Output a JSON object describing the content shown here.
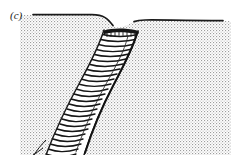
{
  "figure": {
    "panel_label": "(c)",
    "caption_text": "",
    "width_px": 231,
    "height_px": 155,
    "background_color": "#ffffff",
    "type": "geological-cross-section"
  },
  "colors": {
    "stipple_dot": "#9a9a9a",
    "stipple_background": "#ffffff",
    "outline": "#1a1a1a",
    "band_fill": "#ffffff",
    "hatch_line": "#1a1a1a",
    "label_text": "#222222",
    "dark_cap": "#111111"
  },
  "layers": {
    "ground_mass": {
      "name": "stippled-host-rock",
      "fill_pattern": "fine-stipple-dots",
      "left_surface_y": 15,
      "right_surface_y": 21,
      "left_surface_x_start": 33,
      "right_surface_x_end": 223
    },
    "surface_line_left": {
      "name": "ground-surface-left",
      "stroke_width": 1.6
    },
    "surface_line_right": {
      "name": "ground-surface-right",
      "stroke_width": 1.6
    },
    "intruded_band": {
      "name": "hatched-fault-band",
      "hatch_count": 30,
      "stroke_width": 1.4,
      "description": "hatched band descending from notch at top to lower-left corner"
    },
    "dark_cap": {
      "name": "dark-cap-top-of-band",
      "description": "thick dark edge along the upper rim of the band at the surface notch"
    }
  },
  "geometry": {
    "notch_x": 118,
    "notch_top_y": 30,
    "band_top_left_x": 103,
    "band_top_right_x": 137,
    "band_bottom_left_x": 40,
    "band_bottom_right_x": 83,
    "band_bottom_y": 155
  }
}
